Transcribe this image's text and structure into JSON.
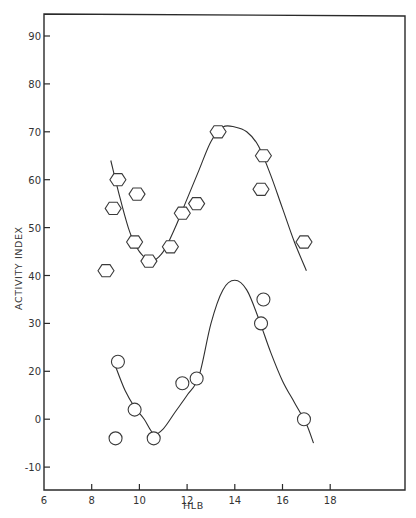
{
  "chart_data": {
    "type": "scatter",
    "title": "",
    "xlabel": "HLB",
    "ylabel": "ACTIVITY INDEX",
    "xlim": [
      6,
      18
    ],
    "x_ticks": [
      6,
      8,
      10,
      12,
      14,
      16,
      18
    ],
    "x_tick_labels": [
      "6",
      "8",
      "10",
      "12",
      "14",
      "16",
      "18"
    ],
    "y_ticks": [
      90,
      80,
      70,
      60,
      50,
      40,
      30,
      20,
      0,
      -10
    ],
    "y_tick_labels": [
      "90",
      "80",
      "70",
      "60",
      "50",
      "40",
      "30",
      "20",
      "0",
      "-10"
    ],
    "ylim": [
      -15,
      95
    ],
    "grid": false,
    "legend": "none",
    "series": [
      {
        "name": "hexagon-series",
        "marker": "hexagon",
        "points": [
          {
            "x": 8.6,
            "y": 41
          },
          {
            "x": 8.9,
            "y": 54
          },
          {
            "x": 9.1,
            "y": 60
          },
          {
            "x": 9.8,
            "y": 47
          },
          {
            "x": 9.9,
            "y": 57
          },
          {
            "x": 10.4,
            "y": 43
          },
          {
            "x": 11.3,
            "y": 46
          },
          {
            "x": 11.8,
            "y": 53
          },
          {
            "x": 12.4,
            "y": 55
          },
          {
            "x": 13.3,
            "y": 70
          },
          {
            "x": 15.1,
            "y": 58
          },
          {
            "x": 15.2,
            "y": 65
          },
          {
            "x": 16.9,
            "y": 47
          }
        ],
        "fit_curve": [
          {
            "x": 8.8,
            "y": 64
          },
          {
            "x": 9.2,
            "y": 56
          },
          {
            "x": 9.6,
            "y": 49
          },
          {
            "x": 10.0,
            "y": 45
          },
          {
            "x": 10.5,
            "y": 43
          },
          {
            "x": 11.0,
            "y": 45
          },
          {
            "x": 11.5,
            "y": 50
          },
          {
            "x": 12.0,
            "y": 56
          },
          {
            "x": 12.5,
            "y": 62
          },
          {
            "x": 13.0,
            "y": 68
          },
          {
            "x": 13.5,
            "y": 71
          },
          {
            "x": 14.0,
            "y": 71
          },
          {
            "x": 14.5,
            "y": 70
          },
          {
            "x": 15.0,
            "y": 67
          },
          {
            "x": 15.5,
            "y": 61
          },
          {
            "x": 16.0,
            "y": 54
          },
          {
            "x": 16.5,
            "y": 47
          },
          {
            "x": 17.0,
            "y": 41
          }
        ]
      },
      {
        "name": "circle-series",
        "marker": "circle",
        "points": [
          {
            "x": 9.0,
            "y": -4
          },
          {
            "x": 9.1,
            "y": 22
          },
          {
            "x": 9.8,
            "y": 4
          },
          {
            "x": 10.6,
            "y": -4
          },
          {
            "x": 11.8,
            "y": 15
          },
          {
            "x": 12.4,
            "y": 17
          },
          {
            "x": 15.1,
            "y": 30
          },
          {
            "x": 15.2,
            "y": 35
          },
          {
            "x": 16.9,
            "y": 0
          }
        ],
        "fit_curve": [
          {
            "x": 9.0,
            "y": 21
          },
          {
            "x": 9.4,
            "y": 12
          },
          {
            "x": 9.8,
            "y": 5
          },
          {
            "x": 10.2,
            "y": 0
          },
          {
            "x": 10.6,
            "y": -3
          },
          {
            "x": 11.0,
            "y": -2
          },
          {
            "x": 11.5,
            "y": 3
          },
          {
            "x": 12.0,
            "y": 10
          },
          {
            "x": 12.5,
            "y": 18
          },
          {
            "x": 13.0,
            "y": 30
          },
          {
            "x": 13.5,
            "y": 37
          },
          {
            "x": 14.0,
            "y": 39
          },
          {
            "x": 14.5,
            "y": 37
          },
          {
            "x": 15.0,
            "y": 31
          },
          {
            "x": 15.5,
            "y": 24
          },
          {
            "x": 16.0,
            "y": 16
          },
          {
            "x": 16.5,
            "y": 7
          },
          {
            "x": 17.0,
            "y": -1
          },
          {
            "x": 17.3,
            "y": -5
          }
        ]
      }
    ]
  }
}
